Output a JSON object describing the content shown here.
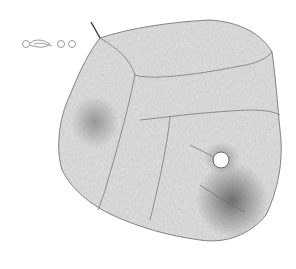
{
  "image": {
    "subject": "pencil sketch of a leaf with a hole",
    "background_color": "#ffffff",
    "leaf_fill": "#d4d4d4",
    "leaf_stroke": "#6a6a6a",
    "shade_color": "#8a8a8a"
  }
}
